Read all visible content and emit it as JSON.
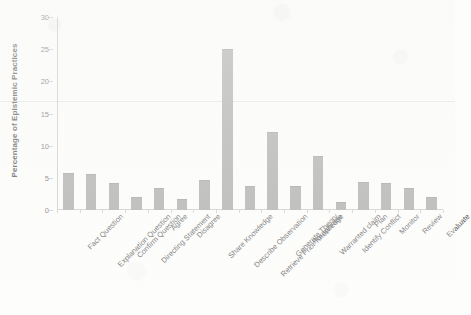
{
  "chart_data": {
    "type": "bar",
    "title": "",
    "subtitle": "",
    "xlabel": "",
    "ylabel": "Percentage of Epistemic Practices",
    "ylim": [
      0,
      30
    ],
    "yticks": [
      0,
      5,
      10,
      15,
      20,
      25,
      30
    ],
    "grid": false,
    "legend": null,
    "bar_color": "#a8a8a8",
    "axis_color": "#c9c9c9",
    "categories": [
      "Fact Question",
      "Explanation Question",
      "Confirm Question",
      "Directing Statement",
      "Agree",
      "Disagree",
      "Share Knowledge",
      "Describe Observation",
      "Retrieve Prior Knowledge",
      "Generate Theory",
      "Paraphrase",
      "Warranted claim",
      "Identify Conflict",
      "Plan",
      "Monitor",
      "Review",
      "Evaluate"
    ],
    "values": [
      5.6,
      5.5,
      4.0,
      1.9,
      3.2,
      1.5,
      4.5,
      24.8,
      3.5,
      11.9,
      3.6,
      8.3,
      1.1,
      4.2,
      4.1,
      3.2,
      1.8
    ]
  },
  "axis": {
    "y_title": "Percentage of Epistemic Practices"
  }
}
